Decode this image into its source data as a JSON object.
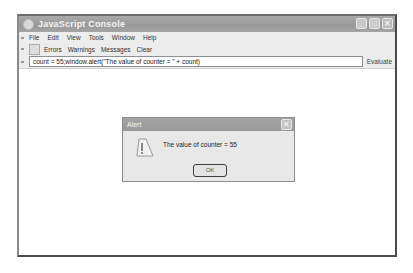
{
  "window": {
    "title": "JavaScript Console",
    "controls": {
      "minimize": "_",
      "maximize": "□",
      "close": "✕"
    }
  },
  "menubar": {
    "items": [
      {
        "label": "File"
      },
      {
        "label": "Edit"
      },
      {
        "label": "View"
      },
      {
        "label": "Tools"
      },
      {
        "label": "Window"
      },
      {
        "label": "Help"
      }
    ]
  },
  "toolbar": {
    "items": [
      {
        "label": "Errors"
      },
      {
        "label": "Warnings"
      },
      {
        "label": "Messages"
      },
      {
        "label": "Clear"
      }
    ]
  },
  "evalbar": {
    "code_value": "count = 55;window.alert(\"The value of counter = \" + count)",
    "evaluate_label": "Evaluate"
  },
  "alert": {
    "title": "Alert",
    "close": "✕",
    "message": "The value of counter = 55",
    "ok_label": "OK"
  }
}
